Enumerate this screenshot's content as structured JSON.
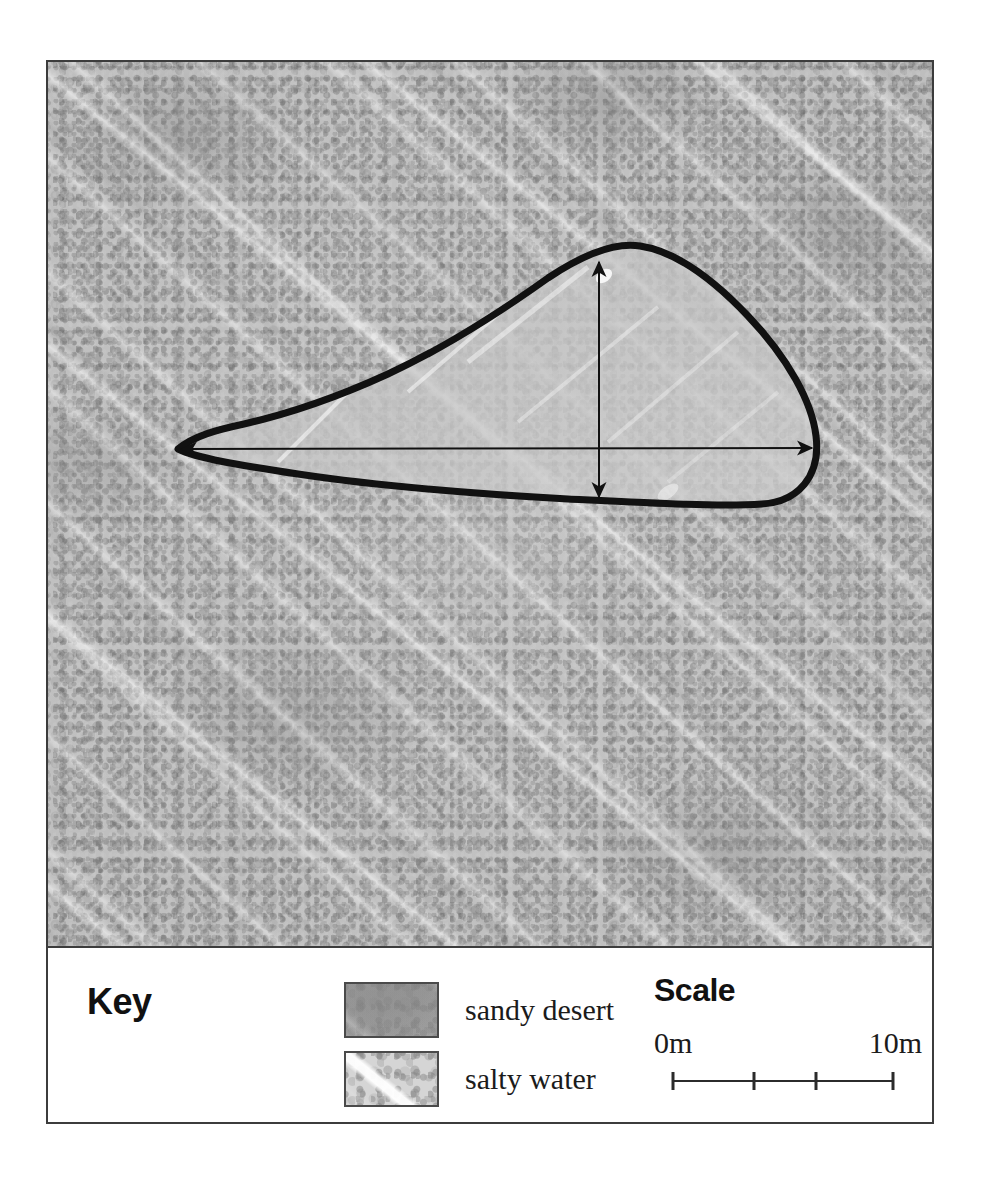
{
  "figure": {
    "type": "annotated-aerial-map"
  },
  "map": {
    "background_label": "sandy desert",
    "feature_label": "salty water",
    "outline_color": "#111111",
    "annotations": [
      {
        "name": "width-measure-arrow",
        "orientation": "horizontal",
        "style": "double-headed"
      },
      {
        "name": "length-measure-arrow",
        "orientation": "vertical",
        "style": "double-headed"
      }
    ]
  },
  "key": {
    "title": "Key",
    "items": [
      {
        "swatch": "sandy-desert-swatch",
        "label": "sandy desert"
      },
      {
        "swatch": "salty-water-swatch",
        "label": "salty water"
      }
    ]
  },
  "scale": {
    "title": "Scale",
    "min_label": "0m",
    "max_label": "10m",
    "ticks": [
      0,
      37,
      65,
      100
    ],
    "unit": "m",
    "span_value": 10
  },
  "colors": {
    "frame": "#3c3c3c",
    "ink": "#111111",
    "panel_bg": "#ffffff",
    "terrain_base": "#bdbdbd"
  }
}
